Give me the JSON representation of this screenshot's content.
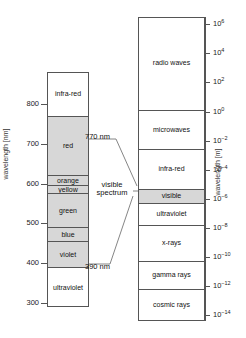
{
  "figure": {
    "type": "electromagnetic-spectrum-diagram"
  },
  "left_panel": {
    "axis_label": "wavelength [nm]",
    "axis_min": 290,
    "axis_max": 880,
    "ticks": [
      {
        "value": 800,
        "label": "800"
      },
      {
        "value": 700,
        "label": "700"
      },
      {
        "value": 600,
        "label": "600"
      },
      {
        "value": 500,
        "label": "500"
      },
      {
        "value": 400,
        "label": "400"
      },
      {
        "value": 300,
        "label": "300"
      }
    ],
    "bands": [
      {
        "label": "infra-red",
        "from": 770,
        "to": 880,
        "shaded": false
      },
      {
        "label": "red",
        "from": 622,
        "to": 770,
        "shaded": true
      },
      {
        "label": "orange",
        "from": 597,
        "to": 622,
        "shaded": true
      },
      {
        "label": "yellow",
        "from": 577,
        "to": 597,
        "shaded": true
      },
      {
        "label": "green",
        "from": 492,
        "to": 577,
        "shaded": true
      },
      {
        "label": "blue",
        "from": 455,
        "to": 492,
        "shaded": true
      },
      {
        "label": "violet",
        "from": 390,
        "to": 455,
        "shaded": true
      },
      {
        "label": "ultraviolet",
        "from": 290,
        "to": 390,
        "shaded": false
      }
    ]
  },
  "callouts": {
    "upper": "770 nm",
    "lower": "390 nm",
    "visible_spectrum_line1": "visible",
    "visible_spectrum_line2": "spectrum"
  },
  "right_panel": {
    "axis_label": "wavelength [m]",
    "ticks": [
      {
        "exp": "6",
        "mantissa": "10"
      },
      {
        "exp": "4",
        "mantissa": "10"
      },
      {
        "exp": "2",
        "mantissa": "10"
      },
      {
        "exp": "0",
        "mantissa": "10"
      },
      {
        "exp": "-2",
        "mantissa": "10"
      },
      {
        "exp": "-4",
        "mantissa": "10"
      },
      {
        "exp": "-6",
        "mantissa": "10"
      },
      {
        "exp": "-8",
        "mantissa": "10"
      },
      {
        "exp": "-10",
        "mantissa": "10"
      },
      {
        "exp": "-12",
        "mantissa": "10"
      },
      {
        "exp": "-14",
        "mantissa": "10"
      }
    ],
    "bands": [
      {
        "label": "radio waves",
        "shaded": false
      },
      {
        "label": "microwaves",
        "shaded": false
      },
      {
        "label": "infra-red",
        "shaded": false
      },
      {
        "label": "visible",
        "shaded": true
      },
      {
        "label": "ultraviolet",
        "shaded": false
      },
      {
        "label": "x-rays",
        "shaded": false
      },
      {
        "label": "gamma rays",
        "shaded": false
      },
      {
        "label": "cosmic rays",
        "shaded": false
      }
    ]
  },
  "chart_data": {
    "type": "bar",
    "title": "",
    "xlabel": "",
    "ylabel": "wavelength",
    "panels": [
      {
        "name": "visible-spectrum-detail",
        "ylabel": "wavelength [nm]",
        "ylim": [
          290,
          880
        ],
        "yticks": [
          800,
          700,
          600,
          500,
          400,
          300
        ],
        "categories": [
          "infra-red",
          "red",
          "orange",
          "yellow",
          "green",
          "blue",
          "violet",
          "ultraviolet"
        ],
        "ranges_nm": [
          [
            770,
            880
          ],
          [
            622,
            770
          ],
          [
            597,
            622
          ],
          [
            577,
            597
          ],
          [
            492,
            577
          ],
          [
            455,
            492
          ],
          [
            390,
            455
          ],
          [
            290,
            390
          ]
        ]
      },
      {
        "name": "full-em-spectrum",
        "ylabel": "wavelength [m]",
        "ylim_log10": [
          -14,
          6
        ],
        "yticks_log10": [
          6,
          4,
          2,
          0,
          -2,
          -4,
          -6,
          -8,
          -10,
          -12,
          -14
        ],
        "categories": [
          "radio waves",
          "microwaves",
          "infra-red",
          "visible",
          "ultraviolet",
          "x-rays",
          "gamma rays",
          "cosmic rays"
        ],
        "ranges_log10": [
          [
            0.1,
            6.5
          ],
          [
            -2.6,
            0.1
          ],
          [
            -5.35,
            -2.6
          ],
          [
            -6.3,
            -5.35
          ],
          [
            -7.8,
            -6.3
          ],
          [
            -10.3,
            -7.8
          ],
          [
            -12.2,
            -10.3
          ],
          [
            -14.4,
            -12.2
          ]
        ]
      }
    ]
  },
  "colors": {
    "shade": "#d7d7d7",
    "line": "#555555",
    "text": "#111111",
    "background": "#ffffff"
  }
}
